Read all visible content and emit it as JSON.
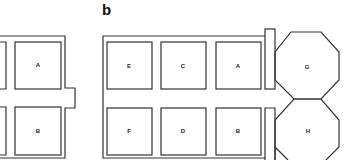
{
  "figure": {
    "panels": [
      {
        "id": "a",
        "label": "",
        "rooms": [
          {
            "id": "A",
            "label": "A"
          },
          {
            "id": "B",
            "label": "B"
          }
        ]
      },
      {
        "id": "b",
        "label": "b",
        "rooms": [
          {
            "id": "E",
            "label": "E"
          },
          {
            "id": "C",
            "label": "C"
          },
          {
            "id": "A",
            "label": "A"
          },
          {
            "id": "F",
            "label": "F"
          },
          {
            "id": "D",
            "label": "D"
          },
          {
            "id": "B",
            "label": "B"
          },
          {
            "id": "G",
            "label": "G",
            "shape": "octagon"
          },
          {
            "id": "H",
            "label": "H",
            "shape": "octagon"
          }
        ]
      }
    ],
    "colors": {
      "line": "#333333",
      "background": "#ffffff"
    }
  }
}
